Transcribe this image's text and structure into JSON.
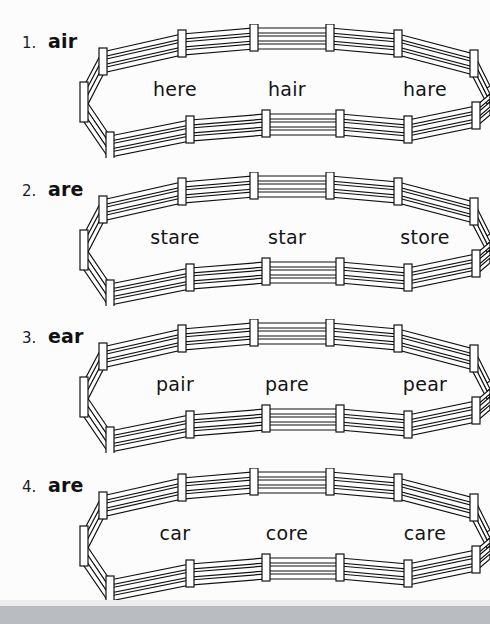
{
  "page": {
    "type": "worksheet"
  },
  "rows": [
    {
      "number": "1.",
      "family": "air",
      "words": [
        "here",
        "hair",
        "hare"
      ],
      "fence_name": "corral-fence-1"
    },
    {
      "number": "2.",
      "family": "are",
      "words": [
        "stare",
        "star",
        "store"
      ],
      "fence_name": "corral-fence-2"
    },
    {
      "number": "3.",
      "family": "ear",
      "words": [
        "pair",
        "pare",
        "pear"
      ],
      "fence_name": "corral-fence-3"
    },
    {
      "number": "4.",
      "family": "are",
      "words": [
        "car",
        "core",
        "care"
      ],
      "fence_name": "corral-fence-4"
    }
  ],
  "style": {
    "ink": "#111111",
    "paper": "#fcfcfc",
    "bottom_band": "#b9bcc0"
  }
}
